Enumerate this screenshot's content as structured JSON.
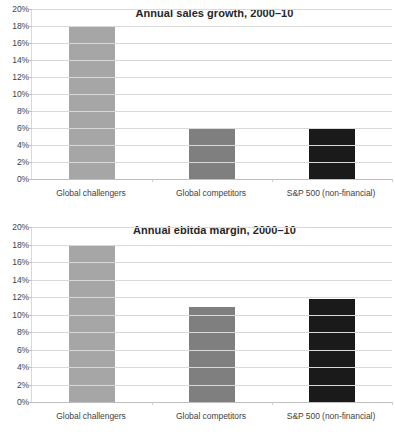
{
  "chart_data": [
    {
      "type": "bar",
      "title": "Annual sales growth, 2000–10",
      "xlabel": "",
      "ylabel": "",
      "categories": [
        "Global challengers",
        "Global competitors",
        "S&P 500 (non-financial)"
      ],
      "values": [
        18.0,
        5.9,
        5.9
      ],
      "value_unit": "%",
      "ylim": [
        0,
        20
      ],
      "ytick_step": 2,
      "ytick_labels": [
        "0%",
        "2%",
        "4%",
        "6%",
        "8%",
        "10%",
        "12%",
        "14%",
        "16%",
        "18%",
        "20%"
      ],
      "grid": true,
      "legend": "none",
      "bar_colors": [
        "#a6a6a6",
        "#7f7f7f",
        "#1a1a1a"
      ]
    },
    {
      "type": "bar",
      "title": "Annual ebitda margin, 2000–10",
      "xlabel": "",
      "ylabel": "",
      "categories": [
        "Global challengers",
        "Global competitors",
        "S&P 500 (non-financial)"
      ],
      "values": [
        18.0,
        10.9,
        11.8
      ],
      "value_unit": "%",
      "ylim": [
        0,
        20
      ],
      "ytick_step": 2,
      "ytick_labels": [
        "0%",
        "2%",
        "4%",
        "6%",
        "8%",
        "10%",
        "12%",
        "14%",
        "16%",
        "18%",
        "20%"
      ],
      "grid": true,
      "legend": "none",
      "bar_colors": [
        "#a6a6a6",
        "#7f7f7f",
        "#1a1a1a"
      ]
    }
  ],
  "colors": {
    "background": "#ffffff",
    "gridline": "#d9d9d9",
    "axis": "#bfbfbf",
    "tick_text": "#3f3f3f",
    "title_text": "#262626"
  }
}
